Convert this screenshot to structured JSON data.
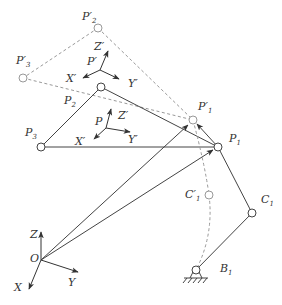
{
  "diagram": {
    "colors": {
      "solid_line": "#444444",
      "dashed_line": "#999999",
      "label": "#333333",
      "background": "#ffffff"
    },
    "points": {
      "P1": {
        "label": "P",
        "sub": "1",
        "x": 218,
        "y": 147
      },
      "P2": {
        "label": "P",
        "sub": "2",
        "x": 101,
        "y": 87
      },
      "P3": {
        "label": "P",
        "sub": "3",
        "x": 41,
        "y": 147
      },
      "P1_prime": {
        "label": "P'",
        "sub": "1",
        "x": 193,
        "y": 120
      },
      "P2_prime": {
        "label": "P'",
        "sub": "2",
        "x": 98,
        "y": 28
      },
      "P3_prime": {
        "label": "P'",
        "sub": "3",
        "x": 23,
        "y": 78
      },
      "C1": {
        "label": "C",
        "sub": "1",
        "x": 252,
        "y": 213
      },
      "C1_prime": {
        "label": "C'",
        "sub": "1",
        "x": 209,
        "y": 195
      },
      "B1": {
        "label": "B",
        "sub": "1",
        "x": 196,
        "y": 273
      },
      "O": {
        "label": "O",
        "x": 41,
        "y": 260
      }
    },
    "frames": {
      "base": {
        "origin": "O",
        "x_label": "X",
        "y_label": "Y",
        "z_label": "Z"
      },
      "platform": {
        "origin": "P",
        "x_label": "X'",
        "y_label": "Y'",
        "z_label": "Z'"
      },
      "platform_moved": {
        "origin": "P'",
        "x_label": "X'",
        "y_label": "Y'",
        "z_label": "Z'"
      }
    },
    "labels": {
      "P1": "P",
      "P1_sub": "1",
      "P2": "P",
      "P2_sub": "2",
      "P3": "P",
      "P3_sub": "3",
      "P1p": "P′",
      "P1p_sub": "1",
      "P2p": "P′",
      "P2p_sub": "2",
      "P3p": "P′",
      "P3p_sub": "3",
      "C1": "C",
      "C1_sub": "1",
      "C1p": "C′",
      "C1p_sub": "1",
      "B1": "B",
      "B1_sub": "1",
      "O": "O",
      "X": "X",
      "Y": "Y",
      "Z": "Z",
      "P": "P",
      "Xp_a": "X′",
      "Yp_a": "Y′",
      "Zp_a": "Z′",
      "Pp": "P′",
      "Xp_b": "X′",
      "Yp_b": "Y′",
      "Zp_b": "Z′"
    }
  }
}
